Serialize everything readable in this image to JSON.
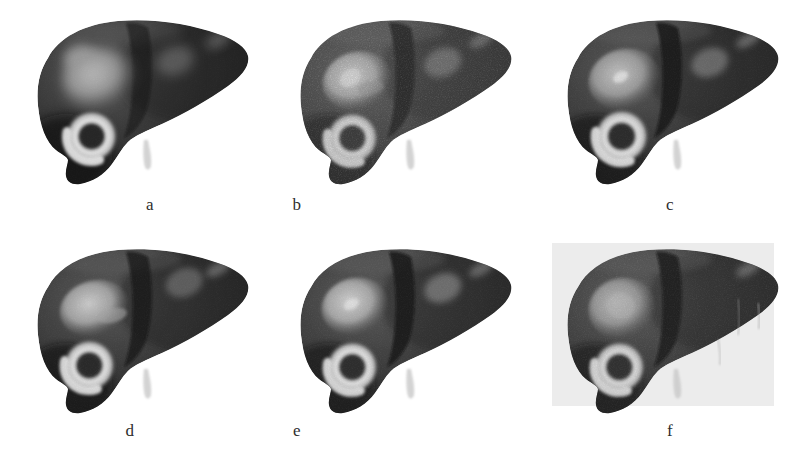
{
  "figure": {
    "kind": "medical-image-figure",
    "rows": 2,
    "columns": 3,
    "background_color": "#ffffff",
    "label_color": "#2e2e2e"
  },
  "palette": {
    "page_background": "#ffffff",
    "liver_dark": "#1b1b1b",
    "liver_mid": "#3b3b3b",
    "liver_light": "#565656",
    "fissure_dark": "#0d0d0d",
    "lesion_bright": "#d9d9d9",
    "lesion_gray": "#8f8f8f",
    "ring_highlight": "#e8e8e8",
    "panel_f_plate": "#ececec",
    "ligament_pale": "#c9c9c9"
  },
  "panels": [
    {
      "id": "a",
      "label": "a",
      "label_x": 150,
      "label_y": 196,
      "x": 22,
      "y": 14,
      "width": 232,
      "height": 180,
      "plate": false,
      "noise": 0.06,
      "smoothness": "very-smooth",
      "description": "Smooth shaded liver, broad diffuse specular highlight over left lobe, faint fissure, ring lesion lower-left, faint lesion upper-right",
      "specular_highlight": true,
      "fissure_strength": 0.35,
      "upper_left_lesion": {
        "visible": true,
        "style": "diffuse-highlight",
        "brightness": 0.55,
        "cx": 0.33,
        "cy": 0.36,
        "rx": 0.16,
        "ry": 0.17
      },
      "ring_lesion": {
        "visible": true,
        "cx": 0.3,
        "cy": 0.68,
        "r": 0.115,
        "ring_brightness": 0.88
      },
      "upper_right_lesion": {
        "visible": true,
        "brightness": 0.22,
        "cx": 0.66,
        "cy": 0.26
      },
      "ligament": {
        "visible": true,
        "cx": 0.555,
        "cy": 0.9
      }
    },
    {
      "id": "b",
      "label": "b",
      "label_x": 297,
      "label_y": 196,
      "x": 285,
      "y": 14,
      "width": 232,
      "height": 180,
      "plate": false,
      "noise": 0.3,
      "smoothness": "grainy",
      "description": "Noisy / speckled rendering, strong dark vertical fissure band, irregular bright lesion upper-left, ring lesion lower-left",
      "specular_highlight": false,
      "fissure_strength": 0.95,
      "upper_left_lesion": {
        "visible": true,
        "style": "irregular-bright",
        "brightness": 0.8,
        "cx": 0.31,
        "cy": 0.37,
        "rx": 0.15,
        "ry": 0.16
      },
      "ring_lesion": {
        "visible": true,
        "cx": 0.29,
        "cy": 0.69,
        "r": 0.115,
        "ring_brightness": 0.92
      },
      "upper_right_lesion": {
        "visible": true,
        "brightness": 0.4,
        "cx": 0.68,
        "cy": 0.27
      },
      "ligament": {
        "visible": true,
        "cx": 0.555,
        "cy": 0.9
      }
    },
    {
      "id": "c",
      "label": "c",
      "label_x": 670,
      "label_y": 196,
      "x": 552,
      "y": 14,
      "width": 232,
      "height": 180,
      "plate": false,
      "noise": 0.12,
      "smoothness": "smooth",
      "description": "Smoothed rendering, well-defined gray elliptical lesion upper-left with small bright core, ring lesion lower-left, fissure present",
      "specular_highlight": false,
      "fissure_strength": 0.85,
      "upper_left_lesion": {
        "visible": true,
        "style": "defined-ellipse",
        "brightness": 0.62,
        "cx": 0.31,
        "cy": 0.36,
        "rx": 0.155,
        "ry": 0.165
      },
      "ring_lesion": {
        "visible": true,
        "cx": 0.3,
        "cy": 0.68,
        "r": 0.12,
        "ring_brightness": 0.9
      },
      "upper_right_lesion": {
        "visible": true,
        "brightness": 0.42,
        "cx": 0.68,
        "cy": 0.27
      },
      "ligament": {
        "visible": true,
        "cx": 0.565,
        "cy": 0.9
      }
    },
    {
      "id": "d",
      "label": "d",
      "label_x": 130,
      "label_y": 422,
      "x": 22,
      "y": 243,
      "width": 232,
      "height": 180,
      "plate": false,
      "noise": 0.1,
      "smoothness": "smooth",
      "description": "Smooth rendering, soft bright lesion upper-left with comma-shaped tail, ring lesion lower-left, fissure present",
      "specular_highlight": false,
      "fissure_strength": 0.7,
      "upper_left_lesion": {
        "visible": true,
        "style": "soft-comma",
        "brightness": 0.7,
        "cx": 0.31,
        "cy": 0.36,
        "rx": 0.15,
        "ry": 0.15
      },
      "ring_lesion": {
        "visible": true,
        "cx": 0.29,
        "cy": 0.68,
        "r": 0.115,
        "ring_brightness": 0.9
      },
      "upper_right_lesion": {
        "visible": true,
        "brightness": 0.3,
        "cx": 0.7,
        "cy": 0.22
      },
      "ligament": {
        "visible": true,
        "cx": 0.555,
        "cy": 0.9
      }
    },
    {
      "id": "e",
      "label": "e",
      "label_x": 297,
      "label_y": 422,
      "x": 285,
      "y": 243,
      "width": 232,
      "height": 180,
      "plate": false,
      "noise": 0.14,
      "smoothness": "smooth",
      "description": "Smooth rendering, bright rounded lesion upper-left, clear ring lesion lower-left, visible lesion in right lobe, strong fissure",
      "specular_highlight": false,
      "fissure_strength": 0.9,
      "upper_left_lesion": {
        "visible": true,
        "style": "rounded-bright",
        "brightness": 0.76,
        "cx": 0.3,
        "cy": 0.35,
        "rx": 0.145,
        "ry": 0.155
      },
      "ring_lesion": {
        "visible": true,
        "cx": 0.29,
        "cy": 0.69,
        "r": 0.115,
        "ring_brightness": 0.94
      },
      "upper_right_lesion": {
        "visible": true,
        "brightness": 0.5,
        "cx": 0.68,
        "cy": 0.25
      },
      "ligament": {
        "visible": true,
        "cx": 0.555,
        "cy": 0.9
      }
    },
    {
      "id": "f",
      "label": "f",
      "label_x": 670,
      "label_y": 422,
      "x": 552,
      "y": 243,
      "width": 232,
      "height": 180,
      "plate": true,
      "plate_x": 545,
      "plate_y": 236,
      "plate_width": 229,
      "plate_height": 170,
      "noise": 0.18,
      "smoothness": "smooth",
      "description": "Rendering on light gray plate background, pale gray lesion upper-left, ring lesion lower-left, faint streak artifacts at right",
      "specular_highlight": false,
      "fissure_strength": 0.92,
      "upper_left_lesion": {
        "visible": true,
        "style": "pale-blob",
        "brightness": 0.58,
        "cx": 0.3,
        "cy": 0.36,
        "rx": 0.145,
        "ry": 0.165
      },
      "ring_lesion": {
        "visible": true,
        "cx": 0.29,
        "cy": 0.69,
        "r": 0.115,
        "ring_brightness": 0.88
      },
      "upper_right_lesion": {
        "visible": false,
        "brightness": 0.12,
        "cx": 0.68,
        "cy": 0.25
      },
      "ligament": {
        "visible": true,
        "cx": 0.555,
        "cy": 0.9
      },
      "artifacts": true
    }
  ],
  "caption_letters": [
    "a",
    "b",
    "c",
    "d",
    "e",
    "f"
  ]
}
